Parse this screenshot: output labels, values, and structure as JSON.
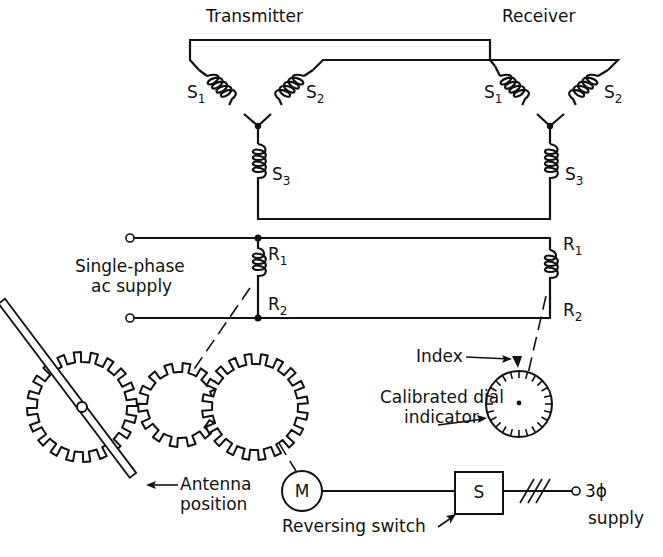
{
  "labels": {
    "transmitter": "Transmitter",
    "receiver": "Receiver",
    "supply_line1": "Single-phase",
    "supply_line2": "ac supply",
    "index": "Index",
    "dial_line1": "Calibrated dial",
    "dial_line2": "indicator",
    "antenna_line1": "Antenna",
    "antenna_line2": "position",
    "motor": "M",
    "switch": "S",
    "reversing_switch": "Reversing switch",
    "three_phase_line1": "3ϕ",
    "three_phase_line2": "supply"
  },
  "windings": {
    "transmitter": {
      "s1": {
        "main": "S",
        "sub": "1"
      },
      "s2": {
        "main": "S",
        "sub": "2"
      },
      "s3": {
        "main": "S",
        "sub": "3"
      },
      "r1": {
        "main": "R",
        "sub": "1"
      },
      "r2": {
        "main": "R",
        "sub": "2"
      }
    },
    "receiver": {
      "s1": {
        "main": "S",
        "sub": "1"
      },
      "s2": {
        "main": "S",
        "sub": "2"
      },
      "s3": {
        "main": "S",
        "sub": "3"
      },
      "r1": {
        "main": "R",
        "sub": "1"
      },
      "r2": {
        "main": "R",
        "sub": "2"
      }
    }
  },
  "colors": {
    "ink": "#111111",
    "background": "#ffffff"
  }
}
